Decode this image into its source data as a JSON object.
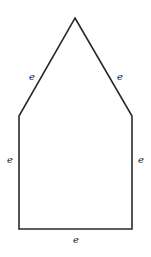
{
  "diagram": {
    "title": "",
    "shape": "pentagon (house shape)",
    "stroke_color": "#2a2a2a",
    "background": "#ffffff",
    "vertices": [
      {
        "name": "apex",
        "x": 75,
        "y": 18
      },
      {
        "name": "right-shoulder",
        "x": 132,
        "y": 116
      },
      {
        "name": "bottom-right",
        "x": 132,
        "y": 229
      },
      {
        "name": "bottom-left",
        "x": 19,
        "y": 229
      },
      {
        "name": "left-shoulder",
        "x": 19,
        "y": 116
      }
    ],
    "edge_labels": {
      "upper_left": "e",
      "upper_right": "e",
      "left": "e",
      "right": "e",
      "bottom": "e"
    }
  }
}
